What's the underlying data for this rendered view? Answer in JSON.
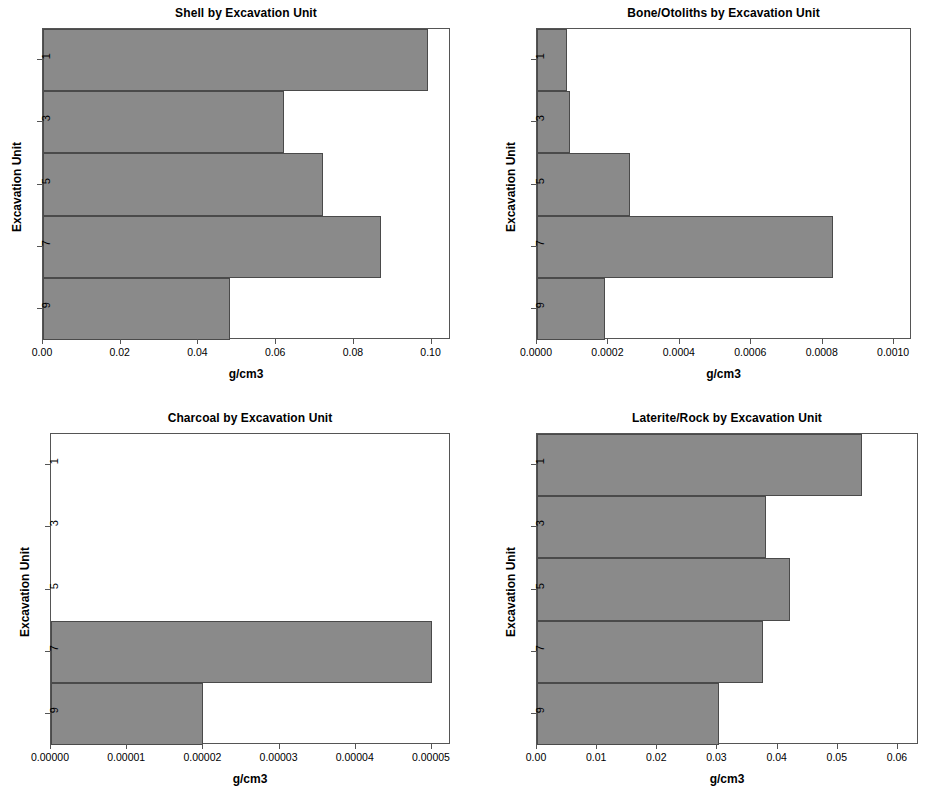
{
  "figure": {
    "background_color": "#ffffff",
    "bar_fill_color": "#8a8a8a",
    "bar_border_color": "#4a4a4a",
    "axis_color": "#555555"
  },
  "chart_data": [
    {
      "type": "bar",
      "orientation": "horizontal",
      "title": "Shell by Excavation Unit",
      "xlabel": "g/cm3",
      "ylabel": "Excavation Unit",
      "categories": [
        "1",
        "3",
        "5",
        "7",
        "9"
      ],
      "ytick_labels": [
        "1",
        "3",
        "5",
        "7",
        "9"
      ],
      "values": [
        0.099,
        0.062,
        0.072,
        0.087,
        0.048
      ],
      "xlim": [
        0.0,
        0.105
      ],
      "xticks": [
        0.0,
        0.02,
        0.04,
        0.06,
        0.08,
        0.1
      ],
      "xtick_labels": [
        "0.00",
        "0.02",
        "0.04",
        "0.06",
        "0.08",
        "0.10"
      ],
      "grid": false,
      "legend": "none"
    },
    {
      "type": "bar",
      "orientation": "horizontal",
      "title": "Bone/Otoliths by Excavation Unit",
      "xlabel": "g/cm3",
      "ylabel": "Excavation Unit",
      "categories": [
        "1",
        "3",
        "5",
        "7",
        "9"
      ],
      "ytick_labels": [
        "1",
        "3",
        "5",
        "7",
        "9"
      ],
      "values": [
        8.5e-05,
        9.3e-05,
        0.00026,
        0.00083,
        0.00019
      ],
      "xlim": [
        0.0,
        0.00105
      ],
      "xticks": [
        0.0,
        0.0002,
        0.0004,
        0.0006,
        0.0008,
        0.001
      ],
      "xtick_labels": [
        "0.0000",
        "0.0002",
        "0.0004",
        "0.0006",
        "0.0008",
        "0.0010"
      ],
      "grid": false,
      "legend": "none"
    },
    {
      "type": "bar",
      "orientation": "horizontal",
      "title": "Charcoal by Excavation Unit",
      "xlabel": "g/cm3",
      "ylabel": "Excavation Unit",
      "categories": [
        "1",
        "3",
        "5",
        "7",
        "9"
      ],
      "ytick_labels": [
        "1",
        "3",
        "5",
        "7",
        "9"
      ],
      "values": [
        0.0,
        0.0,
        0.0,
        5e-05,
        2e-05
      ],
      "xlim": [
        0.0,
        5.25e-05
      ],
      "xticks": [
        0.0,
        1e-05,
        2e-05,
        3e-05,
        4e-05,
        5e-05
      ],
      "xtick_labels": [
        "0.00000",
        "0.00001",
        "0.00002",
        "0.00003",
        "0.00004",
        "0.00005"
      ],
      "grid": false,
      "legend": "none"
    },
    {
      "type": "bar",
      "orientation": "horizontal",
      "title": "Laterite/Rock by Excavation Unit",
      "xlabel": "g/cm3",
      "ylabel": "Excavation Unit",
      "categories": [
        "1",
        "3",
        "5",
        "7",
        "9"
      ],
      "ytick_labels": [
        "1",
        "3",
        "5",
        "7",
        "9"
      ],
      "values": [
        0.054,
        0.038,
        0.042,
        0.0375,
        0.0302
      ],
      "xlim": [
        0.0,
        0.0635
      ],
      "xticks": [
        0.0,
        0.01,
        0.02,
        0.03,
        0.04,
        0.05,
        0.06
      ],
      "xtick_labels": [
        "0.00",
        "0.01",
        "0.02",
        "0.03",
        "0.04",
        "0.05",
        "0.06"
      ],
      "grid": false,
      "legend": "none"
    }
  ]
}
